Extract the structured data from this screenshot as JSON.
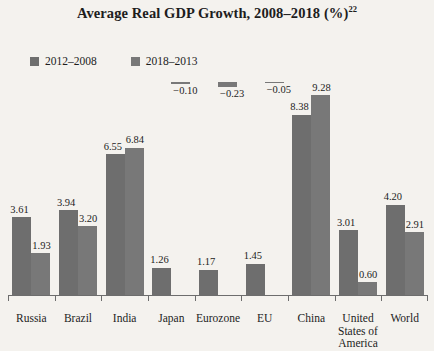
{
  "chart_data": {
    "type": "bar",
    "title": "Average Real GDP Growth, 2008–2018 (%)",
    "title_superscript": "22",
    "xlabel": "",
    "ylabel": "",
    "grid": false,
    "legend_position": "top-left",
    "ylim": [
      -1,
      10
    ],
    "categories": [
      "Russia",
      "Brazil",
      "India",
      "Japan",
      "Eurozone",
      "EU",
      "China",
      "United States of America",
      "World"
    ],
    "series": [
      {
        "name": "2012–2008",
        "color": "#6e6e6e",
        "values": [
          3.61,
          3.94,
          6.55,
          1.26,
          1.17,
          1.45,
          8.38,
          3.01,
          4.2
        ],
        "labels": [
          "3.61",
          "3.94",
          "6.55",
          "1.26",
          "1.17",
          "1.45",
          "8.38",
          "3.01",
          "4.20"
        ]
      },
      {
        "name": "2018–2013",
        "color": "#787878",
        "values": [
          1.93,
          3.2,
          6.84,
          -0.1,
          -0.23,
          -0.05,
          9.28,
          0.6,
          2.91
        ],
        "labels": [
          "1.93",
          "3.20",
          "6.84",
          "−0.10",
          "−0.23",
          "−0.05",
          "9.28",
          "0.60",
          "2.91"
        ]
      }
    ]
  },
  "legend": {
    "items": [
      {
        "label": "2012–2008",
        "color": "#6e6e6e"
      },
      {
        "label": "2018–2013",
        "color": "#787878"
      }
    ]
  },
  "colors": {
    "background": "#f4f2ee",
    "axis": "#6d6d6d",
    "text": "#1d1d1d",
    "series_1": "#6e6e6e",
    "series_2": "#787878"
  }
}
